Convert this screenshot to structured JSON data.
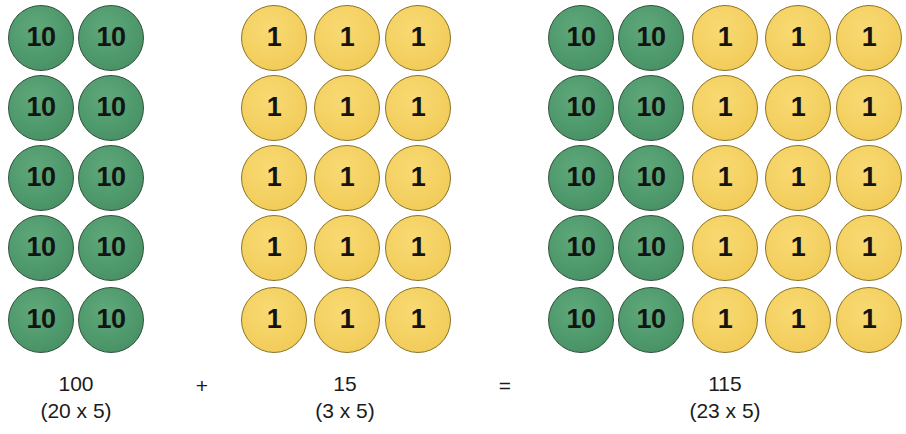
{
  "figure": {
    "background_color": "#ffffff",
    "ten_color": "#4f9a6d",
    "ten_border_color": "#2f4f39",
    "one_color": "#f4d061",
    "one_border_color": "#8a7222",
    "text_color": "#1c1c1c"
  },
  "counters": {
    "ten_label": "10",
    "one_label": "1"
  },
  "groups": [
    {
      "name": "first-addend",
      "total": "100",
      "expression": "(20 x 5)",
      "columns": [
        {
          "type": "ten",
          "x": 8
        },
        {
          "type": "ten",
          "x": 78
        }
      ],
      "label_center_x": 76
    },
    {
      "name": "second-addend",
      "total": "15",
      "expression": "(3 x 5)",
      "columns": [
        {
          "type": "one",
          "x": 241
        },
        {
          "type": "one",
          "x": 314
        },
        {
          "type": "one",
          "x": 385
        }
      ],
      "label_center_x": 345
    },
    {
      "name": "sum",
      "total": "115",
      "expression": "(23 x 5)",
      "columns": [
        {
          "type": "ten",
          "x": 548
        },
        {
          "type": "ten",
          "x": 618
        },
        {
          "type": "one",
          "x": 692
        },
        {
          "type": "one",
          "x": 765
        },
        {
          "type": "one",
          "x": 836
        }
      ],
      "label_center_x": 725
    }
  ],
  "rows_y": [
    5,
    75,
    145,
    215,
    287
  ],
  "operators": [
    {
      "name": "plus",
      "symbol": "+",
      "x": 202,
      "y": 373
    },
    {
      "name": "equals",
      "symbol": "=",
      "x": 505,
      "y": 373
    }
  ],
  "label_rows": {
    "total_y": 371,
    "expression_y": 398
  },
  "chart_data": {
    "type": "diagram",
    "title": "100 + 15 = 115",
    "equation": "100 + 15 = 115",
    "terms": [
      {
        "label": "100",
        "detail": "(20 x 5)",
        "tens": 10,
        "ones": 0,
        "tens_columns": 2,
        "ones_columns": 0,
        "rows": 5
      },
      {
        "label": "15",
        "detail": "(3 x 5)",
        "tens": 0,
        "ones": 15,
        "tens_columns": 0,
        "ones_columns": 3,
        "rows": 5
      },
      {
        "label": "115",
        "detail": "(23 x 5)",
        "tens": 10,
        "ones": 15,
        "tens_columns": 2,
        "ones_columns": 3,
        "rows": 5
      }
    ]
  }
}
